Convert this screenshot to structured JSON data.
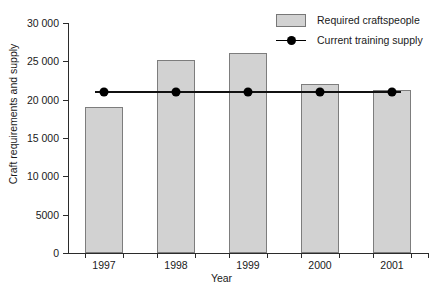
{
  "chart_data": {
    "type": "bar",
    "title": "",
    "xlabel": "Year",
    "ylabel": "Craft requirements and supply",
    "categories": [
      "1997",
      "1998",
      "1999",
      "2000",
      "2001"
    ],
    "ylim": [
      0,
      30000
    ],
    "ytick_values": [
      0,
      5000,
      10000,
      15000,
      20000,
      25000,
      30000
    ],
    "ytick_labels": [
      "0",
      "5000",
      "10 000",
      "15 000",
      "20 000",
      "25 000",
      "30 000"
    ],
    "grid": false,
    "legend_position": "top-right",
    "series": [
      {
        "name": "Required craftspeople",
        "type": "bar",
        "color": "#d2d2d2",
        "edge_color": "#7d7d7d",
        "values": [
          19000,
          25200,
          26100,
          22100,
          21300
        ]
      },
      {
        "name": "Current training supply",
        "type": "line",
        "color": "#000000",
        "marker": "circle",
        "values": [
          21000,
          21000,
          21000,
          21000,
          21000
        ]
      }
    ]
  },
  "legend": {
    "items": [
      {
        "label": "Required craftspeople",
        "marker": "swatch-icon"
      },
      {
        "label": "Current training supply",
        "marker": "line-dot-icon"
      }
    ]
  },
  "axes": {
    "x_title": "Year",
    "y_title": "Craft requirements and supply"
  }
}
